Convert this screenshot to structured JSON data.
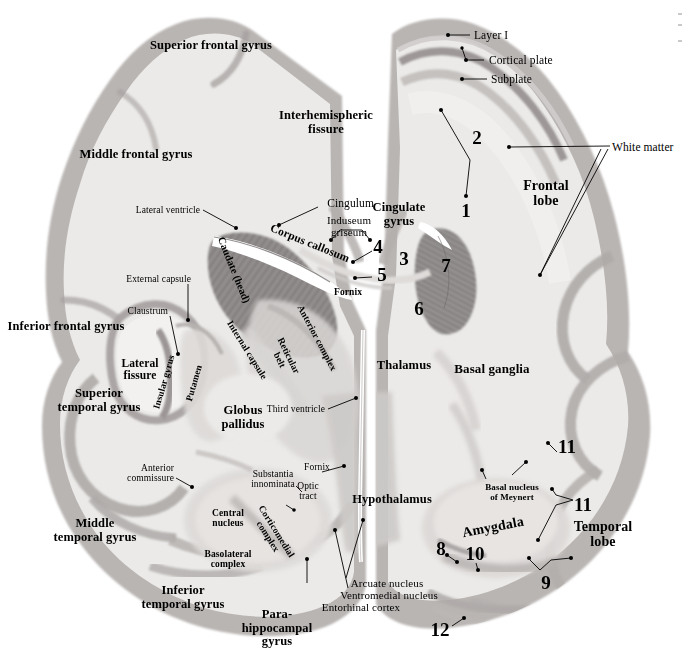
{
  "figure": {
    "type": "annotated-histology-photomicrograph",
    "width": 692,
    "height": 663,
    "background_color": "#ffffff",
    "tissue_tint": "#d8d6d4",
    "cortex_tint": "#a9a5a4",
    "caudate_tint": "#8f8b8b",
    "label_color": "#000000"
  },
  "labels": {
    "superior_frontal_gyrus": "Superior frontal gyrus",
    "middle_frontal_gyrus": "Middle frontal gyrus",
    "inferior_frontal_gyrus": "Inferior frontal gyrus",
    "superior_temporal_gyrus": "Superior\ntemporal gyrus",
    "middle_temporal_gyrus": "Middle\ntemporal gyrus",
    "inferior_temporal_gyrus": "Inferior\ntemporal gyrus",
    "parahippocampal_gyrus": "Para-\nhippocampal\ngyrus",
    "interhemispheric_fissure": "Interhemispheric\nfissure",
    "lateral_fissure": "Lateral\nfissure",
    "layer_i": "Layer I",
    "cortical_plate": "Cortical plate",
    "subplate": "Subplate",
    "white_matter": "White matter",
    "frontal_lobe": "Frontal\nlobe",
    "temporal_lobe": "Temporal\nlobe",
    "basal_ganglia": "Basal ganglia",
    "cingulum": "Cingulum",
    "cingulate_gyrus": "Cingulate\ngyrus",
    "induseum_griseum": "Induseum\ngriseum",
    "corpus_callosum": "Corpus callosum",
    "lateral_ventricle": "Lateral ventricle",
    "caudate_head": "Caudate (head)",
    "fornix_upper": "Fornix",
    "fornix_lower": "Fornix",
    "external_capsule": "External capsule",
    "claustrum": "Claustrum",
    "insular_gyrus": "Insular gyrus",
    "putamen": "Putamen",
    "internal_capsule": "Internal capsule",
    "anterior_complex": "Anterior complex",
    "reticular_belt": "Reticular\nbelt",
    "thalamus": "Thalamus",
    "third_ventricle": "Third ventricle",
    "globus_pallidus": "Globus\npallidus",
    "anterior_commissure": "Anterior\ncommissure",
    "substantia_innominata": "Substantia\ninnominata",
    "optic_tract": "Optic\ntract",
    "hypothalamus": "Hypothalamus",
    "arcuate_nucleus": "Arcuate nucleus",
    "ventromedial_nucleus": "Ventromedial nucleus",
    "entorhinal_cortex": "Entorhinal cortex",
    "central_nucleus": "Central\nnucleus",
    "corticomedial_complex": "Corticomedial\ncomplex",
    "basolateral_complex": "Basolateral\ncomplex",
    "amygdala": "Amygdala",
    "basal_nucleus_of_meynert": "Basal nucleus\nof Meynert"
  },
  "numbered_markers": [
    {
      "id": "1",
      "text": "1",
      "x": 466,
      "y": 211
    },
    {
      "id": "2",
      "text": "2",
      "x": 477,
      "y": 138
    },
    {
      "id": "3",
      "text": "3",
      "x": 404,
      "y": 259
    },
    {
      "id": "4",
      "text": "4",
      "x": 378,
      "y": 247
    },
    {
      "id": "5",
      "text": "5",
      "x": 382,
      "y": 275
    },
    {
      "id": "6",
      "text": "6",
      "x": 419,
      "y": 309
    },
    {
      "id": "7",
      "text": "7",
      "x": 446,
      "y": 266
    },
    {
      "id": "8",
      "text": "8",
      "x": 441,
      "y": 549
    },
    {
      "id": "9",
      "text": "9",
      "x": 546,
      "y": 583
    },
    {
      "id": "10",
      "text": "10",
      "x": 475,
      "y": 554
    },
    {
      "id": "11",
      "text": "11",
      "x": 567,
      "y": 447
    },
    {
      "id": "11b",
      "text": "11",
      "x": 583,
      "y": 505
    },
    {
      "id": "12",
      "text": "12",
      "x": 440,
      "y": 630
    }
  ]
}
